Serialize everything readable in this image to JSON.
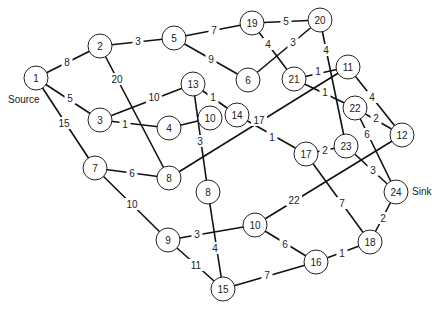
{
  "annotations": {
    "source_label": "Source",
    "sink_label": "Sink"
  },
  "nodes": [
    {
      "id": "n1",
      "label": "1",
      "x": 36,
      "y": 78
    },
    {
      "id": "n2",
      "label": "2",
      "x": 100,
      "y": 46
    },
    {
      "id": "n5",
      "label": "5",
      "x": 174,
      "y": 38
    },
    {
      "id": "n19",
      "label": "19",
      "x": 252,
      "y": 23
    },
    {
      "id": "n20",
      "label": "20",
      "x": 320,
      "y": 20
    },
    {
      "id": "n6",
      "label": "6",
      "x": 248,
      "y": 80
    },
    {
      "id": "n21",
      "label": "21",
      "x": 294,
      "y": 79
    },
    {
      "id": "n11",
      "label": "11",
      "x": 348,
      "y": 67
    },
    {
      "id": "n13",
      "label": "13",
      "x": 193,
      "y": 84
    },
    {
      "id": "n3",
      "label": "3",
      "x": 100,
      "y": 120
    },
    {
      "id": "n4",
      "label": "4",
      "x": 169,
      "y": 128
    },
    {
      "id": "n10a",
      "label": "10",
      "x": 210,
      "y": 118
    },
    {
      "id": "n14",
      "label": "14",
      "x": 237,
      "y": 115
    },
    {
      "id": "n22",
      "label": "22",
      "x": 355,
      "y": 108
    },
    {
      "id": "n12",
      "label": "12",
      "x": 402,
      "y": 135
    },
    {
      "id": "n17",
      "label": "17",
      "x": 306,
      "y": 154
    },
    {
      "id": "n23",
      "label": "23",
      "x": 346,
      "y": 146
    },
    {
      "id": "n7",
      "label": "7",
      "x": 95,
      "y": 168
    },
    {
      "id": "n8a",
      "label": "8",
      "x": 169,
      "y": 178
    },
    {
      "id": "n8b",
      "label": "8",
      "x": 208,
      "y": 192
    },
    {
      "id": "n24",
      "label": "24",
      "x": 396,
      "y": 192
    },
    {
      "id": "n10b",
      "label": "10",
      "x": 255,
      "y": 225
    },
    {
      "id": "n9",
      "label": "9",
      "x": 168,
      "y": 240
    },
    {
      "id": "n18",
      "label": "18",
      "x": 370,
      "y": 242
    },
    {
      "id": "n16",
      "label": "16",
      "x": 316,
      "y": 262
    },
    {
      "id": "n15",
      "label": "15",
      "x": 223,
      "y": 289
    }
  ],
  "edges": [
    {
      "from": "n1",
      "to": "n2",
      "weight": "8"
    },
    {
      "from": "n1",
      "to": "n3",
      "weight": "5"
    },
    {
      "from": "n1",
      "to": "n7",
      "weight": "15"
    },
    {
      "from": "n2",
      "to": "n5",
      "weight": "3"
    },
    {
      "from": "n2",
      "to": "n8a",
      "weight": "20"
    },
    {
      "from": "n5",
      "to": "n19",
      "weight": "7"
    },
    {
      "from": "n5",
      "to": "n6",
      "weight": "9"
    },
    {
      "from": "n19",
      "to": "n20",
      "weight": "5"
    },
    {
      "from": "n19",
      "to": "n21",
      "weight": "4"
    },
    {
      "from": "n6",
      "to": "n20",
      "weight": "3"
    },
    {
      "from": "n20",
      "to": "n23",
      "weight": "4"
    },
    {
      "from": "n21",
      "to": "n11",
      "weight": "1"
    },
    {
      "from": "n21",
      "to": "n22",
      "weight": "1"
    },
    {
      "from": "n11",
      "to": "n12",
      "weight": "4"
    },
    {
      "from": "n11",
      "to": "n8a",
      "weight": "17"
    },
    {
      "from": "n22",
      "to": "n12",
      "weight": "2"
    },
    {
      "from": "n22",
      "to": "n24",
      "weight": "6"
    },
    {
      "from": "n3",
      "to": "n13",
      "weight": "10"
    },
    {
      "from": "n3",
      "to": "n4",
      "weight": "1"
    },
    {
      "from": "n4",
      "to": "n10a",
      "weight": ""
    },
    {
      "from": "n13",
      "to": "n14",
      "weight": "1"
    },
    {
      "from": "n13",
      "to": "n8b",
      "weight": "3"
    },
    {
      "from": "n14",
      "to": "n17",
      "weight": "1"
    },
    {
      "from": "n17",
      "to": "n23",
      "weight": "2"
    },
    {
      "from": "n17",
      "to": "n18",
      "weight": "7"
    },
    {
      "from": "n23",
      "to": "n24",
      "weight": "3"
    },
    {
      "from": "n12",
      "to": "n10b",
      "weight": "22"
    },
    {
      "from": "n7",
      "to": "n8a",
      "weight": "6"
    },
    {
      "from": "n7",
      "to": "n9",
      "weight": "10"
    },
    {
      "from": "n8b",
      "to": "n15",
      "weight": "4"
    },
    {
      "from": "n9",
      "to": "n10b",
      "weight": "3"
    },
    {
      "from": "n9",
      "to": "n15",
      "weight": "11"
    },
    {
      "from": "n10b",
      "to": "n16",
      "weight": "6"
    },
    {
      "from": "n15",
      "to": "n16",
      "weight": "7"
    },
    {
      "from": "n16",
      "to": "n18",
      "weight": "1"
    },
    {
      "from": "n18",
      "to": "n24",
      "weight": "2"
    }
  ],
  "edge_label_positions": {
    "n1-n2": [
      67,
      62
    ],
    "n1-n3": [
      70,
      98
    ],
    "n1-n7": [
      64,
      123
    ],
    "n2-n5": [
      138,
      41
    ],
    "n2-n8a": [
      117,
      79
    ],
    "n5-n19": [
      214,
      30
    ],
    "n5-n6": [
      211,
      59
    ],
    "n19-n20": [
      286,
      21
    ],
    "n19-n21": [
      268,
      44
    ],
    "n6-n20": [
      293,
      42
    ],
    "n20-n23": [
      326,
      50
    ],
    "n21-n11": [
      318,
      71
    ],
    "n21-n22": [
      325,
      92
    ],
    "n11-n12": [
      372,
      97
    ],
    "n11-n8a": [
      259,
      120
    ],
    "n22-n12": [
      376,
      118
    ],
    "n22-n24": [
      367,
      134
    ],
    "n3-n13": [
      154,
      97
    ],
    "n3-n4": [
      125,
      124
    ],
    "n4-n10a": [
      0,
      0
    ],
    "n13-n14": [
      213,
      97
    ],
    "n13-n8b": [
      200,
      141
    ],
    "n14-n17": [
      272,
      137
    ],
    "n17-n23": [
      325,
      150
    ],
    "n17-n18": [
      342,
      203
    ],
    "n23-n24": [
      373,
      170
    ],
    "n12-n10b": [
      294,
      200
    ],
    "n7-n8a": [
      132,
      173
    ],
    "n7-n9": [
      132,
      204
    ],
    "n8b-n15": [
      215,
      248
    ],
    "n9-n10b": [
      197,
      234
    ],
    "n9-n15": [
      196,
      265
    ],
    "n10b-n16": [
      285,
      244
    ],
    "n15-n16": [
      267,
      275
    ],
    "n16-n18": [
      342,
      253
    ],
    "n18-n24": [
      383,
      218
    ]
  },
  "colors": {
    "background": "#ffffff",
    "stroke": "#111111",
    "text": "#222222",
    "node_fill": "#ffffff"
  }
}
